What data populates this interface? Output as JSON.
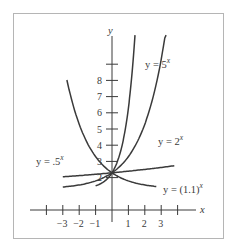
{
  "chart_data": {
    "type": "line",
    "title": "",
    "xlabel": "x",
    "ylabel": "y",
    "x_ticks": [
      -3,
      -2,
      -1,
      1,
      2,
      3
    ],
    "x_tick_labels": [
      "−3",
      "−2",
      "−1",
      "1",
      "2",
      "3"
    ],
    "y_ticks": [
      2,
      3,
      4,
      5,
      6,
      7,
      8,
      9
    ],
    "y_tick_labels": [
      "2",
      "3",
      "4",
      "5",
      "6",
      "7",
      "8",
      ""
    ],
    "xlim": [
      -4,
      5
    ],
    "ylim": [
      -1,
      9.5
    ],
    "grid": false,
    "legend": "inline labels",
    "series": [
      {
        "name": "y = 5^x",
        "label_base": "y = 5",
        "label_exp": "x",
        "function": "5^x",
        "x_range": [
          -1.0,
          1.4
        ]
      },
      {
        "name": "y = 2^x",
        "label_base": "y = 2",
        "label_exp": "x",
        "function": "2^x",
        "x_range": [
          -3.0,
          3.3
        ]
      },
      {
        "name": "y = .5^x",
        "label_base": "y = .5",
        "label_exp": "x",
        "function": "0.5^x",
        "x_range": [
          -2.75,
          2.7
        ]
      },
      {
        "name": "y = (1.1)^x",
        "label_base": "y = (1.1)",
        "label_exp": "x",
        "function": "1.1^x",
        "x_range": [
          -3.0,
          3.8
        ]
      }
    ],
    "annotations": [
      "All curves pass through (0, 1)"
    ]
  },
  "axes": {
    "x_label": "x",
    "y_label": "y"
  }
}
